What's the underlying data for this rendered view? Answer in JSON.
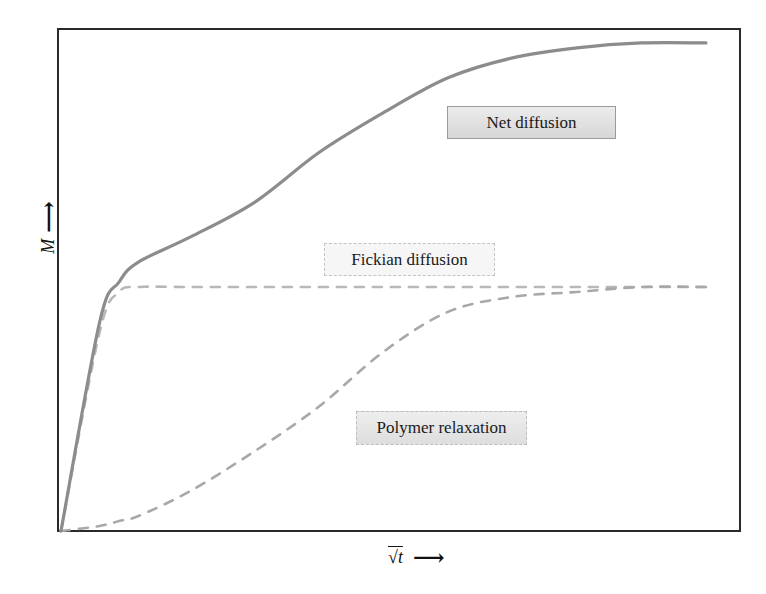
{
  "chart_data": {
    "type": "line",
    "title": "",
    "xlabel": "√t",
    "ylabel": "M",
    "x_arrow": "⟶",
    "y_arrow": "⟶",
    "grid": false,
    "ticks": "none",
    "legend_position": "inline annotations",
    "x": [
      0,
      0.06,
      0.09,
      0.12,
      0.2,
      0.3,
      0.4,
      0.5,
      0.6,
      0.7,
      0.8,
      0.9,
      1.0
    ],
    "series": [
      {
        "name": "Net diffusion",
        "style": "solid",
        "color": "#8c8c8c",
        "values": [
          0,
          0.42,
          0.5,
          0.54,
          0.59,
          0.66,
          0.76,
          0.84,
          0.91,
          0.95,
          0.97,
          0.98,
          0.98
        ]
      },
      {
        "name": "Fickian diffusion",
        "style": "dashed",
        "color": "#b8b8b8",
        "values": [
          0,
          0.4,
          0.48,
          0.49,
          0.49,
          0.49,
          0.49,
          0.49,
          0.49,
          0.49,
          0.49,
          0.49,
          0.49
        ]
      },
      {
        "name": "Polymer relaxation",
        "style": "dashed",
        "color": "#a8a8a8",
        "values": [
          0,
          0.01,
          0.02,
          0.03,
          0.08,
          0.16,
          0.25,
          0.36,
          0.44,
          0.47,
          0.48,
          0.49,
          0.49
        ]
      }
    ],
    "annotations": [
      {
        "text": "Net diffusion",
        "near_series": "Net diffusion"
      },
      {
        "text": "Fickian diffusion",
        "near_series": "Fickian diffusion"
      },
      {
        "text": "Polymer relaxation",
        "near_series": "Polymer relaxation"
      }
    ]
  },
  "labels": {
    "net": "Net diffusion",
    "fick": "Fickian diffusion",
    "poly": "Polymer relaxation",
    "y_axis": "M",
    "x_axis": "√t",
    "arrow": "⟶"
  },
  "colors": {
    "frame": "#2a2a2a",
    "net_line": "#8c8c8c",
    "fick_line": "#b8b8b8",
    "poly_line": "#a8a8a8"
  }
}
